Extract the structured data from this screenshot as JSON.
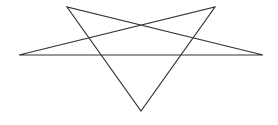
{
  "diagram": {
    "shape": "pentagram",
    "stroke_color": "#333333",
    "stroke_width": 1.2,
    "background": "#ffffff",
    "vertices": [
      {
        "name": "top-left",
        "x": 67,
        "y": 7
      },
      {
        "name": "bottom",
        "x": 141,
        "y": 111
      },
      {
        "name": "top-right",
        "x": 215,
        "y": 7
      },
      {
        "name": "left",
        "x": 19,
        "y": 55
      },
      {
        "name": "right",
        "x": 263,
        "y": 55
      }
    ]
  }
}
